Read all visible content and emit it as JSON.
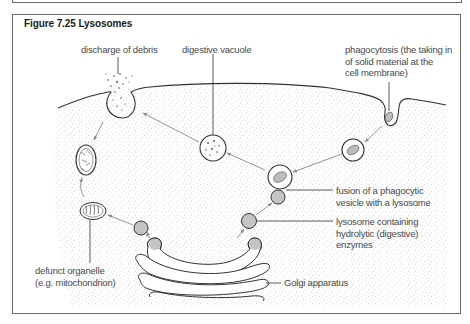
{
  "figure": {
    "title": "Figure 7.25  Lysosomes"
  },
  "labels": {
    "discharge": "discharge of debris",
    "digestive_vacuole": "digestive vacuole",
    "phagocytosis": [
      "phagocytosis (the taking in",
      "of solid material at the",
      "cell membrane)"
    ],
    "fusion": [
      "fusion of a phagocytic",
      "vesicle with a lysosome"
    ],
    "lysosome": [
      "lysosome containing",
      "hydrolytic (digestive)",
      "enzymes"
    ],
    "golgi": "Golgi apparatus",
    "defunct": [
      "defunct organelle",
      "(e.g. mitochondrion)"
    ]
  },
  "colors": {
    "line": "#333333",
    "arrow": "#8a8a8a",
    "stipple": "#9a9a9a",
    "lysosome_fill": "#c4c4c4",
    "frame": "#6b6b6b"
  }
}
